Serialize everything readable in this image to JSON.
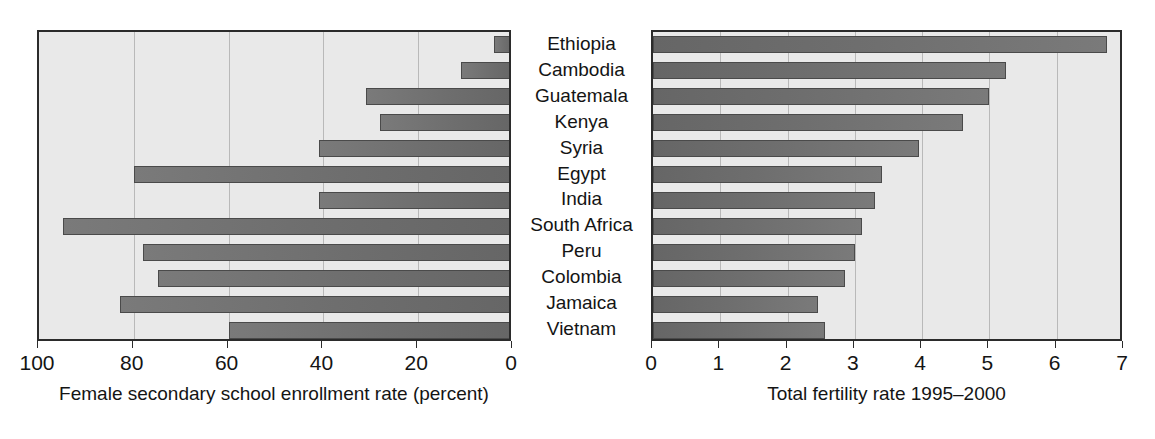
{
  "chart_data": {
    "type": "bar",
    "title": "",
    "orientation": "horizontal",
    "layout": "back-to-back paired panels sharing category axis",
    "categories": [
      "Ethiopia",
      "Cambodia",
      "Guatemala",
      "Kenya",
      "Syria",
      "Egypt",
      "India",
      "South Africa",
      "Peru",
      "Colombia",
      "Jamaica",
      "Vietnam"
    ],
    "panels": [
      {
        "id": "left",
        "xlabel": "Female secondary school enrollment rate (percent)",
        "ticks": [
          100,
          80,
          60,
          40,
          20,
          0
        ],
        "tick_labels": [
          "100",
          "80",
          "60",
          "40",
          "20",
          "0"
        ],
        "xlim": [
          100,
          0
        ],
        "direction": "right-to-left (reversed axis, bars grow leftward from 0)",
        "grid": true,
        "values": [
          4,
          11,
          31,
          28,
          41,
          80,
          41,
          95,
          78,
          75,
          83,
          60
        ]
      },
      {
        "id": "right",
        "xlabel": "Total fertility rate 1995–2000",
        "ticks": [
          0,
          1,
          2,
          3,
          4,
          5,
          6,
          7
        ],
        "tick_labels": [
          "0",
          "1",
          "2",
          "3",
          "4",
          "5",
          "6",
          "7"
        ],
        "xlim": [
          0,
          7
        ],
        "direction": "left-to-right",
        "grid": true,
        "values": [
          6.75,
          5.25,
          5.0,
          4.6,
          3.95,
          3.4,
          3.3,
          3.1,
          3.0,
          2.85,
          2.45,
          2.55
        ]
      }
    ],
    "colors": {
      "bar_fill": "#6e6e6e",
      "bar_edge": "#4a4a4a",
      "plot_background": "#e9e9e9",
      "grid": "#b9b9b9",
      "axis": "#2b2b2b",
      "page_background": "#ffffff",
      "text": "#141414"
    }
  }
}
